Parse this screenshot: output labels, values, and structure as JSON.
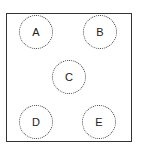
{
  "diagram": {
    "nodes": [
      {
        "id": "A",
        "label": "A",
        "x": 19,
        "y": 15
      },
      {
        "id": "B",
        "label": "B",
        "x": 83,
        "y": 15
      },
      {
        "id": "C",
        "label": "C",
        "x": 52,
        "y": 60
      },
      {
        "id": "D",
        "label": "D",
        "x": 19,
        "y": 105
      },
      {
        "id": "E",
        "label": "E",
        "x": 82,
        "y": 105
      }
    ]
  }
}
